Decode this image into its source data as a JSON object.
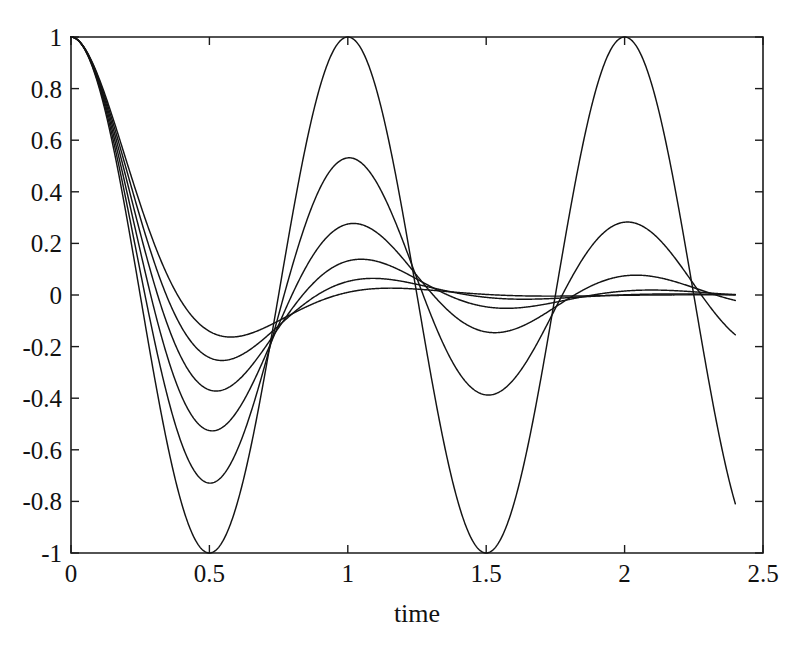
{
  "chart_data": {
    "type": "line",
    "title": "",
    "subtitle": "",
    "xlabel": "time",
    "ylabel": "",
    "xlim": [
      0,
      2.5
    ],
    "ylim": [
      -1,
      1
    ],
    "grid": false,
    "legend": "none",
    "x_ticks": [
      0,
      0.5,
      1,
      1.5,
      2,
      2.5
    ],
    "x_tick_labels": [
      "0",
      "0.5",
      "1",
      "1.5",
      "2",
      "2.5"
    ],
    "y_ticks": [
      1,
      0.8,
      0.6,
      0.4,
      0.2,
      0,
      -0.2,
      -0.4,
      -0.6,
      -0.8,
      -1
    ],
    "y_tick_labels": [
      "1",
      "0.8",
      "0.6",
      "0.4",
      "0.2",
      "0",
      "-0.2",
      "-0.4",
      "-0.6",
      "-0.8",
      "-1"
    ],
    "x_data_range": [
      0,
      2.4
    ],
    "line_color": "#141414",
    "series": [
      {
        "name": "zeta = 0.000",
        "zeta": 0.0,
        "omega": 6.2831853,
        "peaks": [
          {
            "t": 0.5,
            "y": -1.0
          },
          {
            "t": 1.0,
            "y": 1.0
          },
          {
            "t": 1.5,
            "y": -1.0
          },
          {
            "t": 2.0,
            "y": 1.0
          }
        ],
        "end_value": -0.75
      },
      {
        "name": "zeta = 0.100",
        "zeta": 0.1,
        "omega": 6.2831853,
        "peaks": [
          {
            "t": 0.5,
            "y": -0.73
          },
          {
            "t": 1.0,
            "y": 0.54
          },
          {
            "t": 1.5,
            "y": -0.38
          },
          {
            "t": 2.0,
            "y": 0.29
          }
        ],
        "end_value": -0.19
      },
      {
        "name": "zeta = 0.200",
        "zeta": 0.2,
        "omega": 6.2831853,
        "peaks": [
          {
            "t": 0.5,
            "y": -0.52
          },
          {
            "t": 1.0,
            "y": 0.285
          },
          {
            "t": 1.5,
            "y": -0.145
          },
          {
            "t": 2.0,
            "y": 0.08
          }
        ],
        "end_value": 0.03
      },
      {
        "name": "zeta = 0.300",
        "zeta": 0.3,
        "omega": 6.2831853,
        "peaks": [
          {
            "t": 0.5,
            "y": -0.36
          },
          {
            "t": 1.0,
            "y": 0.14
          },
          {
            "t": 1.5,
            "y": -0.055
          },
          {
            "t": 2.0,
            "y": 0.025
          }
        ],
        "end_value": 0.01
      },
      {
        "name": "zeta = 0.400",
        "zeta": 0.4,
        "omega": 6.2831853,
        "peaks": [
          {
            "t": 0.5,
            "y": -0.25
          },
          {
            "t": 1.0,
            "y": 0.065
          },
          {
            "t": 1.5,
            "y": -0.02
          },
          {
            "t": 2.0,
            "y": 0.006
          }
        ],
        "end_value": 0.003
      },
      {
        "name": "zeta = 0.500",
        "zeta": 0.5,
        "omega": 6.2831853,
        "peaks": [
          {
            "t": 0.5,
            "y": -0.145
          },
          {
            "t": 1.0,
            "y": 0.03
          },
          {
            "t": 1.5,
            "y": -0.007
          },
          {
            "t": 2.0,
            "y": 0.002
          }
        ],
        "end_value": 0.001
      }
    ]
  },
  "plot_box": {
    "left": 71,
    "top": 37,
    "right": 763,
    "bottom": 553
  }
}
